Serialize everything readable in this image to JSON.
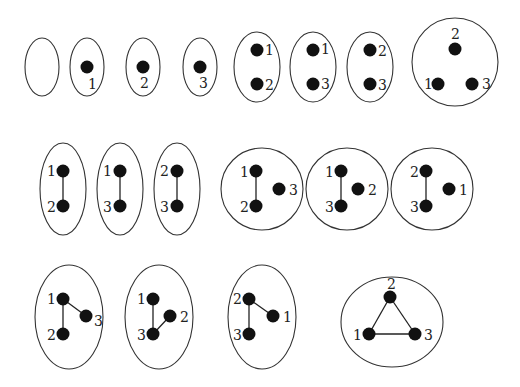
{
  "groups": [
    {
      "id": "g1",
      "shape": "ellipse",
      "cx": 42,
      "cy": 67,
      "rx": 17,
      "ry": 29,
      "nodes": [],
      "edges": []
    },
    {
      "id": "g2",
      "shape": "ellipse",
      "cx": 87,
      "cy": 67,
      "rx": 17,
      "ry": 29,
      "nodes": [
        {
          "label": "1",
          "x": 87,
          "y": 67,
          "lx": 88,
          "ly": 89
        }
      ],
      "edges": []
    },
    {
      "id": "g3",
      "shape": "ellipse",
      "cx": 143,
      "cy": 67,
      "rx": 17,
      "ry": 29,
      "nodes": [
        {
          "label": "2",
          "x": 143,
          "y": 67,
          "lx": 140,
          "ly": 88
        }
      ],
      "edges": []
    },
    {
      "id": "g4",
      "shape": "ellipse",
      "cx": 200,
      "cy": 67,
      "rx": 17,
      "ry": 29,
      "nodes": [
        {
          "label": "3",
          "x": 200,
          "y": 67,
          "lx": 199,
          "ly": 88
        }
      ],
      "edges": []
    },
    {
      "id": "g5",
      "shape": "ellipse",
      "cx": 257,
      "cy": 67,
      "rx": 23,
      "ry": 35,
      "nodes": [
        {
          "label": "1",
          "x": 257,
          "y": 50,
          "lx": 265,
          "ly": 55
        },
        {
          "label": "2",
          "x": 257,
          "y": 84,
          "lx": 265,
          "ly": 90
        }
      ],
      "edges": []
    },
    {
      "id": "g6",
      "shape": "ellipse",
      "cx": 313,
      "cy": 67,
      "rx": 23,
      "ry": 35,
      "nodes": [
        {
          "label": "1",
          "x": 313,
          "y": 50,
          "lx": 321,
          "ly": 54
        },
        {
          "label": "3",
          "x": 313,
          "y": 84,
          "lx": 321,
          "ly": 89
        }
      ],
      "edges": []
    },
    {
      "id": "g7",
      "shape": "ellipse",
      "cx": 370,
      "cy": 67,
      "rx": 23,
      "ry": 35,
      "nodes": [
        {
          "label": "2",
          "x": 370,
          "y": 50,
          "lx": 378,
          "ly": 56
        },
        {
          "label": "3",
          "x": 370,
          "y": 84,
          "lx": 378,
          "ly": 90
        }
      ],
      "edges": []
    },
    {
      "id": "g8",
      "shape": "ellipse",
      "cx": 455,
      "cy": 62,
      "rx": 43,
      "ry": 44,
      "nodes": [
        {
          "label": "2",
          "x": 455,
          "y": 49,
          "lx": 451,
          "ly": 39
        },
        {
          "label": "1",
          "x": 438,
          "y": 84,
          "lx": 424,
          "ly": 89
        },
        {
          "label": "3",
          "x": 472,
          "y": 84,
          "lx": 482,
          "ly": 89
        }
      ],
      "edges": []
    },
    {
      "id": "g9",
      "shape": "ellipse",
      "cx": 63,
      "cy": 189,
      "rx": 23,
      "ry": 46,
      "nodes": [
        {
          "label": "1",
          "x": 63,
          "y": 171,
          "lx": 47,
          "ly": 176
        },
        {
          "label": "2",
          "x": 63,
          "y": 206,
          "lx": 47,
          "ly": 212
        }
      ],
      "edges": [
        [
          0,
          1
        ]
      ]
    },
    {
      "id": "g10",
      "shape": "ellipse",
      "cx": 120,
      "cy": 189,
      "rx": 23,
      "ry": 46,
      "nodes": [
        {
          "label": "1",
          "x": 120,
          "y": 171,
          "lx": 103,
          "ly": 176
        },
        {
          "label": "3",
          "x": 120,
          "y": 206,
          "lx": 103,
          "ly": 212
        }
      ],
      "edges": [
        [
          0,
          1
        ]
      ]
    },
    {
      "id": "g11",
      "shape": "ellipse",
      "cx": 177,
      "cy": 189,
      "rx": 23,
      "ry": 46,
      "nodes": [
        {
          "label": "2",
          "x": 177,
          "y": 171,
          "lx": 160,
          "ly": 176
        },
        {
          "label": "3",
          "x": 177,
          "y": 206,
          "lx": 160,
          "ly": 212
        }
      ],
      "edges": [
        [
          0,
          1
        ]
      ]
    },
    {
      "id": "g12",
      "shape": "ellipse",
      "cx": 262,
      "cy": 189,
      "rx": 41,
      "ry": 41,
      "nodes": [
        {
          "label": "1",
          "x": 256,
          "y": 171,
          "lx": 240,
          "ly": 177
        },
        {
          "label": "2",
          "x": 256,
          "y": 206,
          "lx": 240,
          "ly": 212
        },
        {
          "label": "3",
          "x": 279,
          "y": 189,
          "lx": 289,
          "ly": 195
        }
      ],
      "edges": [
        [
          0,
          1
        ]
      ]
    },
    {
      "id": "g13",
      "shape": "ellipse",
      "cx": 347,
      "cy": 189,
      "rx": 41,
      "ry": 41,
      "nodes": [
        {
          "label": "1",
          "x": 341,
          "y": 171,
          "lx": 325,
          "ly": 177
        },
        {
          "label": "3",
          "x": 341,
          "y": 206,
          "lx": 325,
          "ly": 212
        },
        {
          "label": "2",
          "x": 358,
          "y": 189,
          "lx": 368,
          "ly": 195
        }
      ],
      "edges": [
        [
          0,
          1
        ]
      ]
    },
    {
      "id": "g14",
      "shape": "ellipse",
      "cx": 432,
      "cy": 189,
      "rx": 41,
      "ry": 41,
      "nodes": [
        {
          "label": "2",
          "x": 426,
          "y": 171,
          "lx": 410,
          "ly": 177
        },
        {
          "label": "3",
          "x": 426,
          "y": 206,
          "lx": 410,
          "ly": 212
        },
        {
          "label": "1",
          "x": 449,
          "y": 189,
          "lx": 459,
          "ly": 195
        }
      ],
      "edges": [
        [
          0,
          1
        ]
      ]
    },
    {
      "id": "g15",
      "shape": "ellipse",
      "cx": 69,
      "cy": 317,
      "rx": 34,
      "ry": 52,
      "nodes": [
        {
          "label": "1",
          "x": 63,
          "y": 299,
          "lx": 47,
          "ly": 304
        },
        {
          "label": "2",
          "x": 63,
          "y": 334,
          "lx": 47,
          "ly": 340
        },
        {
          "label": "3",
          "x": 86,
          "y": 316,
          "lx": 94,
          "ly": 326
        }
      ],
      "edges": [
        [
          0,
          1
        ],
        [
          0,
          2
        ]
      ]
    },
    {
      "id": "g16",
      "shape": "ellipse",
      "cx": 159,
      "cy": 317,
      "rx": 34,
      "ry": 52,
      "nodes": [
        {
          "label": "1",
          "x": 153,
          "y": 299,
          "lx": 137,
          "ly": 304
        },
        {
          "label": "3",
          "x": 153,
          "y": 334,
          "lx": 137,
          "ly": 340
        },
        {
          "label": "2",
          "x": 170,
          "y": 316,
          "lx": 180,
          "ly": 322
        }
      ],
      "edges": [
        [
          0,
          1
        ],
        [
          1,
          2
        ]
      ]
    },
    {
      "id": "g17",
      "shape": "ellipse",
      "cx": 262,
      "cy": 317,
      "rx": 34,
      "ry": 52,
      "nodes": [
        {
          "label": "2",
          "x": 249,
          "y": 299,
          "lx": 233,
          "ly": 304
        },
        {
          "label": "3",
          "x": 249,
          "y": 334,
          "lx": 233,
          "ly": 340
        },
        {
          "label": "1",
          "x": 273,
          "y": 316,
          "lx": 283,
          "ly": 322
        }
      ],
      "edges": [
        [
          0,
          1
        ],
        [
          0,
          2
        ]
      ]
    },
    {
      "id": "g18",
      "shape": "ellipse",
      "cx": 392,
      "cy": 322,
      "rx": 51,
      "ry": 45,
      "nodes": [
        {
          "label": "2",
          "x": 390,
          "y": 297,
          "lx": 387,
          "ly": 289
        },
        {
          "label": "1",
          "x": 369,
          "y": 334,
          "lx": 353,
          "ly": 340
        },
        {
          "label": "3",
          "x": 415,
          "y": 334,
          "lx": 424,
          "ly": 340
        }
      ],
      "edges": [
        [
          0,
          1
        ],
        [
          1,
          2
        ],
        [
          0,
          2
        ]
      ]
    }
  ],
  "style": {
    "node_color": "#111111",
    "outline_color": "#333333",
    "node_radius": 6.5
  }
}
